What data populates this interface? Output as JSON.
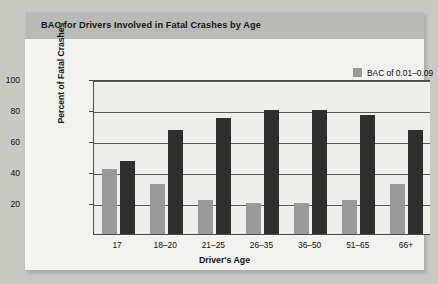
{
  "card": {
    "title": "BAC for Drivers Involved in Fatal Crashes by Age"
  },
  "legend": {
    "position": "top-right",
    "entries": [
      {
        "label": "BAC of 0.01–0.09",
        "color": "#9a9a9a",
        "swatch_name": "legend-swatch-light"
      },
      {
        "label": "BAC of 0.10+",
        "color": "#2f2f2f",
        "swatch_name": "legend-swatch-dark"
      }
    ]
  },
  "axes": {
    "y_title": "Percent of Fatal Crashes",
    "x_title": "Driver's Age",
    "y_ticks": [
      "100",
      "80",
      "60",
      "40",
      "20"
    ]
  },
  "colors": {
    "page_background": "#c9c9c4",
    "card_background": "#f2f2ee",
    "title_band": "#b9b9b5",
    "plot_background": "#eeeeea",
    "axis": "#4a4a4a",
    "gridline": "#5a5a5a",
    "series_light": "#9a9a9a",
    "series_dark": "#2f2f2f"
  },
  "chart_data": {
    "type": "bar",
    "title": "BAC for Drivers Involved in Fatal Crashes by Age",
    "xlabel": "Driver's Age",
    "ylabel": "Percent of Fatal Crashes",
    "ylim": [
      0,
      100
    ],
    "yticks": [
      0,
      20,
      40,
      60,
      80,
      100
    ],
    "grid": true,
    "legend_position": "top-right",
    "categories": [
      "17",
      "18–20",
      "21–25",
      "26–35",
      "36–50",
      "51–65",
      "66+"
    ],
    "series": [
      {
        "name": "BAC of 0.01–0.09",
        "color": "#9a9a9a",
        "values": [
          42,
          32,
          22,
          20,
          20,
          22,
          32
        ]
      },
      {
        "name": "BAC of 0.10+",
        "color": "#2f2f2f",
        "values": [
          47,
          67,
          75,
          80,
          80,
          77,
          67
        ]
      }
    ]
  }
}
